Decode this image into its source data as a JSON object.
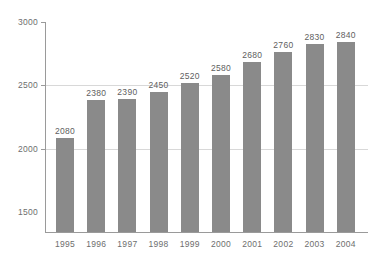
{
  "chart_data": {
    "type": "bar",
    "title": "",
    "subtitle": "",
    "xlabel": "",
    "ylabel": "",
    "categories": [
      "1995",
      "1996",
      "1997",
      "1998",
      "1999",
      "2000",
      "2001",
      "2002",
      "2003",
      "2004"
    ],
    "values": [
      2080,
      2380,
      2390,
      2450,
      2520,
      2580,
      2680,
      2760,
      2830,
      2840
    ],
    "data_labels": [
      "2080",
      "2380",
      "2390",
      "2450",
      "2520",
      "2580",
      "2680",
      "2760",
      "2830",
      "2840"
    ],
    "ylim": [
      1340,
      3000
    ],
    "y_ticks": [
      1500,
      2000,
      2500,
      3000
    ],
    "y_tick_labels": [
      "1500",
      "2000",
      "2500",
      "3000"
    ],
    "gridlines": [
      2000,
      2500,
      3000
    ],
    "grid": true,
    "legend": null,
    "legend_position": "none",
    "colors": {
      "bar": "#8a8a8a",
      "background": "#ffffff",
      "gridline": "#d8d8d8",
      "axis": "#9a9a9a",
      "tick_text": "#6e6e6e",
      "value_text": "#5e5e5e"
    }
  }
}
